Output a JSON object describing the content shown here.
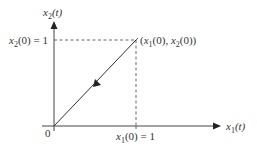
{
  "diagram": {
    "type": "phase-plane-trajectory",
    "axes": {
      "x_label": {
        "var": "x",
        "sub": "1",
        "arg": "(t)"
      },
      "y_label": {
        "var": "x",
        "sub": "2",
        "arg": "(t)"
      },
      "origin_label": "0"
    },
    "initial_point": {
      "label": {
        "open": "(",
        "x": "x",
        "xsub": "1",
        "xarg": "(0), ",
        "y": "x",
        "ysub": "2",
        "yarg": "(0))"
      }
    },
    "x_tick": {
      "var": "x",
      "sub": "1",
      "arg": "(0) = 1"
    },
    "y_tick": {
      "var": "x",
      "sub": "2",
      "arg": "(0) = 1"
    },
    "trajectory": {
      "from": [
        1,
        1
      ],
      "to": [
        0,
        0
      ],
      "direction": "toward-origin"
    },
    "colors": {
      "axis": "#444444",
      "trajectory": "#333333",
      "dashed": "#555555",
      "text": "#333333"
    }
  }
}
